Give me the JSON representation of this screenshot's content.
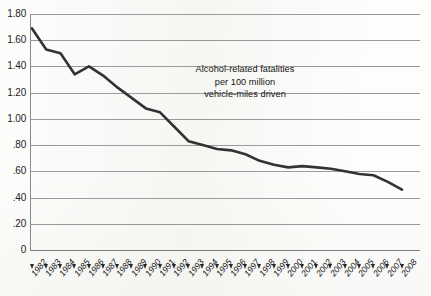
{
  "chart_data": {
    "type": "line",
    "title": "",
    "subtitle": "",
    "annotation_lines": [
      "Alcohol-related fatalities",
      "per 100 million",
      "vehicle-miles driven"
    ],
    "xlabel": "",
    "ylabel": "",
    "ylim": [
      0,
      1.8
    ],
    "y_ticks": [
      0,
      0.2,
      0.4,
      0.6,
      0.8,
      1.0,
      1.2,
      1.4,
      1.6,
      1.8
    ],
    "y_tick_labels": [
      "0",
      ".20",
      ".40",
      ".60",
      ".80",
      "1.00",
      "1.20",
      "1.40",
      "1.60",
      "1.80"
    ],
    "grid": true,
    "grid_axis": "y",
    "legend": false,
    "legend_position": "none",
    "line_color": "#333333",
    "grid_color": "#9a9a9a",
    "background_color": "#fdfdfc",
    "categories": [
      "1982",
      "1983",
      "1984",
      "1985",
      "1986",
      "1987",
      "1988",
      "1989",
      "1990",
      "1991",
      "1992",
      "1993",
      "1994",
      "1995",
      "1996",
      "1997",
      "1998",
      "1999",
      "2000",
      "2001",
      "2002",
      "2003",
      "2004",
      "2005",
      "2006",
      "2007",
      "2008"
    ],
    "values": [
      1.69,
      1.53,
      1.5,
      1.34,
      1.4,
      1.33,
      1.24,
      1.16,
      1.08,
      1.05,
      0.94,
      0.83,
      0.8,
      0.77,
      0.76,
      0.73,
      0.68,
      0.65,
      0.63,
      0.64,
      0.63,
      0.62,
      0.6,
      0.58,
      0.57,
      0.52,
      0.46
    ],
    "series": [
      {
        "name": "Alcohol-related fatalities per 100 million vehicle-miles driven",
        "values": [
          1.69,
          1.53,
          1.5,
          1.34,
          1.4,
          1.33,
          1.24,
          1.16,
          1.08,
          1.05,
          0.94,
          0.83,
          0.8,
          0.77,
          0.76,
          0.73,
          0.68,
          0.65,
          0.63,
          0.64,
          0.63,
          0.62,
          0.6,
          0.58,
          0.57,
          0.52,
          0.46
        ]
      }
    ]
  },
  "annotation": {
    "line1": "Alcohol-related fatalities",
    "line2": "per 100 million",
    "line3": "vehicle-miles driven"
  }
}
